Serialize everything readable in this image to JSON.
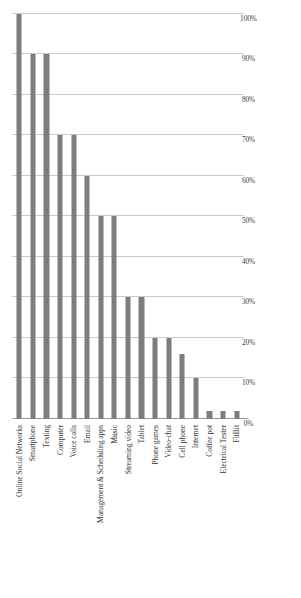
{
  "chart_data": {
    "type": "bar",
    "orientation": "rotated-vertical",
    "title": "",
    "subtitle": "",
    "xlabel": "",
    "ylabel": "",
    "ylim": [
      0,
      100
    ],
    "grid": true,
    "legend": null,
    "legend_position": "none",
    "bar_color": "#7d7d7d",
    "gridline_color": "#c9c9c9",
    "axis_color": "#9a9a9a",
    "tick_suffix": "%",
    "tick_labels": [
      "0%",
      "10%",
      "20%",
      "30%",
      "40%",
      "50%",
      "60%",
      "70%",
      "80%",
      "90%",
      "100%"
    ],
    "tick_values": [
      0,
      10,
      20,
      30,
      40,
      50,
      60,
      70,
      80,
      90,
      100
    ],
    "categories": [
      "Online Social Networks",
      "Smartphone",
      "Texting",
      "Computer",
      "Voice calls",
      "Email",
      "Management & Scheduling apps",
      "Music",
      "Streaming video",
      "Tablet",
      "Phone games",
      "Video-chat",
      "Cell phone",
      "Internet",
      "Coffee pot",
      "Electrical Tester",
      "FitBit"
    ],
    "values": [
      100,
      90,
      90,
      70,
      70,
      60,
      50,
      50,
      30,
      30,
      20,
      20,
      16,
      10,
      2,
      2,
      2
    ]
  }
}
